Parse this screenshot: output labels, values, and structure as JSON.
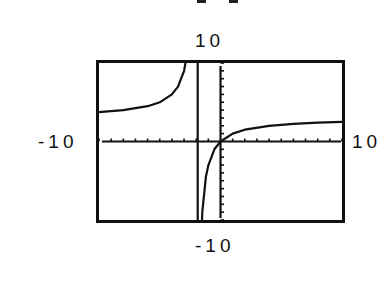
{
  "labels": {
    "ymax": "10",
    "ymin": "-10",
    "xmin": "-10",
    "xmax": "10"
  },
  "chart_data": {
    "type": "line",
    "title": "",
    "xlabel": "",
    "ylabel": "",
    "xlim": [
      -10,
      10
    ],
    "ylim": [
      -10,
      10
    ],
    "xscale_ticks": 1,
    "yscale_ticks": 1,
    "grid": false,
    "legend": null,
    "window_labels": {
      "top": "10",
      "bottom": "-10",
      "left": "-10",
      "right": "10"
    },
    "vertical_asymptote": -2,
    "horizontal_asymptote_approx": 3,
    "series": [
      {
        "name": "left branch",
        "x": [
          -10,
          -8,
          -6,
          -5,
          -4,
          -3.5,
          -3,
          -2.7
        ],
        "y": [
          3.75,
          4.0,
          4.5,
          5.0,
          6.0,
          7.0,
          9.0,
          11.6
        ]
      },
      {
        "name": "right branch",
        "x": [
          -1.7,
          -1.5,
          -1.2,
          -1,
          -0.5,
          0,
          1,
          2,
          4,
          6,
          8,
          10
        ],
        "y": [
          -17,
          -9,
          -4.5,
          -3,
          -1,
          0,
          1.0,
          1.5,
          2.0,
          2.25,
          2.4,
          2.5
        ]
      }
    ],
    "colors": {
      "line": "#111111",
      "frame": "#111111",
      "background": "#ffffff"
    }
  }
}
